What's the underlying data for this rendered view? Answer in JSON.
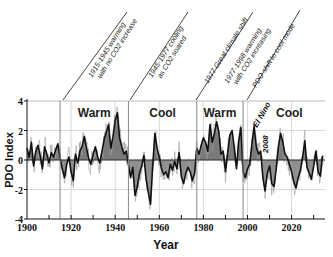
{
  "chart_data": {
    "type": "area",
    "title": "",
    "xlabel": "Year",
    "ylabel": "PDO Index",
    "xlim": [
      1900,
      2035
    ],
    "ylim": [
      -4,
      4
    ],
    "x_ticks": [
      1900,
      1920,
      1940,
      1960,
      1980,
      2000,
      2020
    ],
    "x_tick_labels": [
      "1900",
      "1920",
      "1940",
      "1960",
      "1980",
      "2000",
      "2020"
    ],
    "y_ticks": [
      -4,
      -2,
      0,
      2,
      4
    ],
    "y_tick_labels": [
      "-4",
      "-2",
      "0",
      "2",
      "4"
    ],
    "grid": true,
    "legend": null,
    "regimes": [
      {
        "label": "Warm",
        "start": 1915,
        "end": 1946
      },
      {
        "label": "Cool",
        "start": 1946,
        "end": 1977
      },
      {
        "label": "Warm",
        "start": 1977,
        "end": 1998
      },
      {
        "label": "Cool",
        "start": 1998,
        "end": 2035
      }
    ],
    "annotations": [
      {
        "year": 1915,
        "line1": "1915-1945 warming",
        "line2": "with no CO2 increase"
      },
      {
        "year": 1946,
        "line1": "1945-1977 cooling",
        "line2": "as CO2 soared"
      },
      {
        "year": 1977,
        "line1": "1977 Great climate shift",
        "line2": ""
      },
      {
        "year": 1977,
        "line1": "1977-1998 warming",
        "line2": "with CO2 increasing"
      },
      {
        "year": 1998,
        "line1": "PDO shift to cool mode",
        "line2": ""
      }
    ],
    "inline_labels": [
      {
        "text": "El Nino",
        "x": 2003,
        "y": 2.6
      },
      {
        "text": "2008",
        "x": 2008,
        "y": 1.2
      }
    ],
    "series": [
      {
        "name": "PDO Index (annual approx.)",
        "x": [
          1900,
          1901,
          1902,
          1903,
          1904,
          1905,
          1906,
          1907,
          1908,
          1909,
          1910,
          1911,
          1912,
          1913,
          1914,
          1915,
          1916,
          1917,
          1918,
          1919,
          1920,
          1921,
          1922,
          1923,
          1924,
          1925,
          1926,
          1927,
          1928,
          1929,
          1930,
          1931,
          1932,
          1933,
          1934,
          1935,
          1936,
          1937,
          1938,
          1939,
          1940,
          1941,
          1942,
          1943,
          1944,
          1945,
          1946,
          1947,
          1948,
          1949,
          1950,
          1951,
          1952,
          1953,
          1954,
          1955,
          1956,
          1957,
          1958,
          1959,
          1960,
          1961,
          1962,
          1963,
          1964,
          1965,
          1966,
          1967,
          1968,
          1969,
          1970,
          1971,
          1972,
          1973,
          1974,
          1975,
          1976,
          1977,
          1978,
          1979,
          1980,
          1981,
          1982,
          1983,
          1984,
          1985,
          1986,
          1987,
          1988,
          1989,
          1990,
          1991,
          1992,
          1993,
          1994,
          1995,
          1996,
          1997,
          1998,
          1999,
          2000,
          2001,
          2002,
          2003,
          2004,
          2005,
          2006,
          2007,
          2008,
          2009,
          2010,
          2011,
          2012,
          2013,
          2014,
          2015,
          2016,
          2017,
          2018,
          2019,
          2020,
          2021,
          2022,
          2023,
          2024,
          2025,
          2026,
          2027,
          2028,
          2029,
          2030,
          2031,
          2032,
          2033,
          2034
        ],
        "values": [
          0.8,
          0.2,
          1.2,
          -0.4,
          0.6,
          1.0,
          0.3,
          -0.6,
          0.9,
          0.4,
          -0.2,
          0.5,
          0.2,
          0.7,
          1.1,
          0.1,
          -0.6,
          -1.2,
          -0.3,
          0.2,
          -0.8,
          -1.4,
          0.4,
          -0.2,
          0.6,
          0.9,
          1.6,
          0.8,
          0.1,
          -0.3,
          0.4,
          0.9,
          0.2,
          -0.2,
          0.6,
          1.4,
          1.9,
          2.4,
          0.8,
          1.6,
          2.7,
          3.2,
          1.5,
          0.9,
          0.4,
          0.6,
          -0.3,
          -1.2,
          -0.5,
          -2.4,
          -1.8,
          -0.9,
          -0.4,
          0.3,
          -1.3,
          -2.2,
          -3.0,
          -0.4,
          1.8,
          0.8,
          0.2,
          -0.6,
          -1.0,
          -0.8,
          -1.2,
          -0.3,
          -0.7,
          -0.1,
          -0.6,
          0.5,
          -1.1,
          -1.6,
          -0.9,
          -0.5,
          -0.8,
          -1.4,
          -0.9,
          0.8,
          0.4,
          1.0,
          1.5,
          1.2,
          0.6,
          2.4,
          1.2,
          1.8,
          2.6,
          1.9,
          0.4,
          0.6,
          -0.8,
          0.5,
          1.7,
          2.0,
          0.8,
          -0.6,
          1.3,
          2.2,
          -0.8,
          -1.2,
          -0.6,
          -0.3,
          1.1,
          2.3,
          0.9,
          0.4,
          0.6,
          -1.2,
          -2.1,
          -0.9,
          -0.4,
          -1.6,
          -1.8,
          -0.6,
          0.9,
          1.8,
          1.2,
          0.4,
          0.2,
          -0.3,
          -0.8,
          -1.5,
          -1.9,
          -1.2,
          -0.7,
          0.2,
          1.3,
          -0.5,
          -0.9,
          -1.3,
          -0.4,
          0.6,
          -0.8,
          -1.1,
          0.3
        ]
      }
    ]
  },
  "texts": {
    "ylabel": "PDO Index",
    "xlabel": "Year",
    "el_nino": "El Nino",
    "year_2008": "2008"
  },
  "colors": {
    "positive_fill": "#7a7a7a",
    "negative_fill": "#8f8f8f",
    "line": "#111111",
    "grid": "#c8c8c8",
    "regime_divider": "#888888",
    "axis": "#111111"
  }
}
